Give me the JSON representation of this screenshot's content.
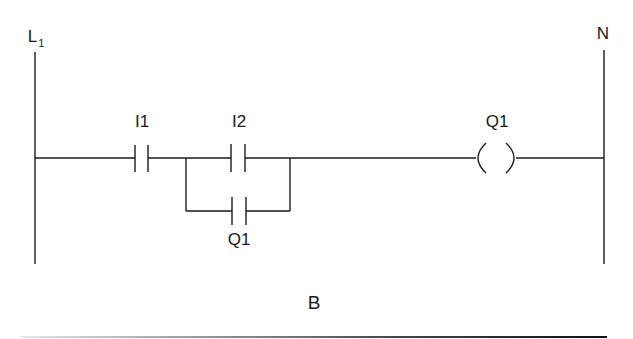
{
  "diagram": {
    "type": "ladder-logic",
    "left_rail": {
      "label": "L",
      "subscript": "1"
    },
    "right_rail": {
      "label": "N"
    },
    "rung": {
      "series_contact": {
        "label": "I1",
        "type": "normally-open"
      },
      "parallel_branch": {
        "top_contact": {
          "label": "I2",
          "type": "normally-open"
        },
        "bottom_contact": {
          "label": "Q1",
          "type": "normally-open"
        }
      },
      "output_coil": {
        "label": "Q1",
        "type": "coil"
      }
    },
    "caption": "B",
    "colors": {
      "stroke": "#1a1a1a",
      "background": "#ffffff"
    }
  }
}
